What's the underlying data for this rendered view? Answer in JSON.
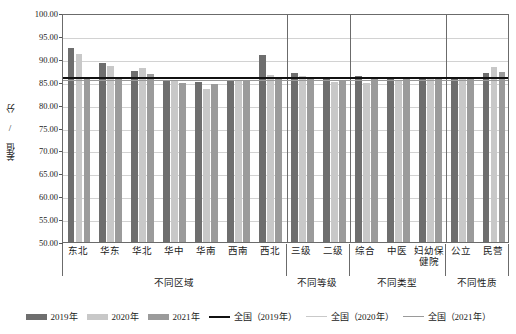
{
  "chart_data": {
    "type": "bar",
    "title": "",
    "xlabel": "",
    "ylabel": "差值 / 分",
    "ylim": [
      50.0,
      100.0
    ],
    "ytick_labels": [
      "100.00",
      "95.00",
      "90.00",
      "85.00",
      "80.00",
      "75.00",
      "70.00",
      "65.00",
      "60.00",
      "55.00",
      "50.00"
    ],
    "ytick_values": [
      100,
      95,
      90,
      85,
      80,
      75,
      70,
      65,
      60,
      55,
      50
    ],
    "grid": true,
    "legend_position": "bottom",
    "categories": [
      "东北",
      "华东",
      "华北",
      "华中",
      "华南",
      "西南",
      "西北",
      "三级",
      "二级",
      "综合",
      "中医",
      "妇幼保健院",
      "公立",
      "民营"
    ],
    "series": [
      {
        "name": "2019年",
        "color": "#6e6e6e",
        "values": [
          92.3,
          89.0,
          87.3,
          85.4,
          84.9,
          85.2,
          90.8,
          86.8,
          85.5,
          86.3,
          85.6,
          86.0,
          86.1,
          87.0
        ]
      },
      {
        "name": "2020年",
        "color": "#c8c8c8",
        "values": [
          91.0,
          88.4,
          88.1,
          85.2,
          83.4,
          85.2,
          86.4,
          86.2,
          84.9,
          84.7,
          85.3,
          85.6,
          85.7,
          88.2
        ]
      },
      {
        "name": "2021年",
        "color": "#9b9b9b",
        "values": [
          85.9,
          86.0,
          86.7,
          84.7,
          84.6,
          85.3,
          86.0,
          86.1,
          85.2,
          86.0,
          85.5,
          85.9,
          86.0,
          87.1
        ]
      }
    ],
    "reference_lines": [
      {
        "name": "全国（2019年）",
        "value": 86.4,
        "color": "#111111",
        "style": "solid-bold"
      },
      {
        "name": "全国（2020年）",
        "value": 85.9,
        "color": "#c9c9c9",
        "style": "solid-light"
      },
      {
        "name": "全国（2021年）",
        "value": 85.7,
        "color": "#9a9a9a",
        "style": "solid-medium"
      }
    ],
    "groups": [
      {
        "label": "不同区域",
        "categories": [
          "东北",
          "华东",
          "华北",
          "华中",
          "华南",
          "西南",
          "西北"
        ]
      },
      {
        "label": "不同等级",
        "categories": [
          "三级",
          "二级"
        ]
      },
      {
        "label": "不同类型",
        "categories": [
          "综合",
          "中医",
          "妇幼保健院"
        ]
      },
      {
        "label": "不同性质",
        "categories": [
          "公立",
          "民营"
        ]
      }
    ]
  },
  "legend": {
    "items": [
      {
        "label": "2019年",
        "kind": "swatch"
      },
      {
        "label": "2020年",
        "kind": "swatch"
      },
      {
        "label": "2021年",
        "kind": "swatch"
      },
      {
        "label": "全国（2019年）",
        "kind": "line"
      },
      {
        "label": "全国（2020年）",
        "kind": "line"
      },
      {
        "label": "全国（2021年）",
        "kind": "line"
      }
    ]
  }
}
